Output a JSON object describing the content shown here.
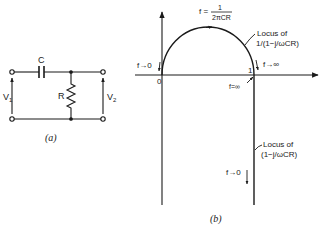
{
  "figure_a": {
    "caption": "(a)",
    "capacitor_label": "C",
    "resistor_label": "R",
    "input_label": "V",
    "input_sub": "1",
    "output_label": "V",
    "output_sub": "2"
  },
  "figure_b": {
    "caption": "(b)",
    "origin_label": "0",
    "unit_label": "1",
    "peak_label_left": "f =",
    "peak_numerator": "1",
    "peak_denominator": "2πCR",
    "circle_locus_line1": "Locus of",
    "circle_locus_line2": "1/(1−j/ωCR)",
    "line_locus_line1": "Locus of",
    "line_locus_line2": "(1−j/ωCR)",
    "f_to_zero_top": "f→0",
    "f_to_inf_top": "f→∞",
    "f_eq_inf": "f=∞",
    "f_to_zero_bottom": "f→0"
  },
  "colors": {
    "ink": "#1a1a1a",
    "background": "#ffffff"
  }
}
